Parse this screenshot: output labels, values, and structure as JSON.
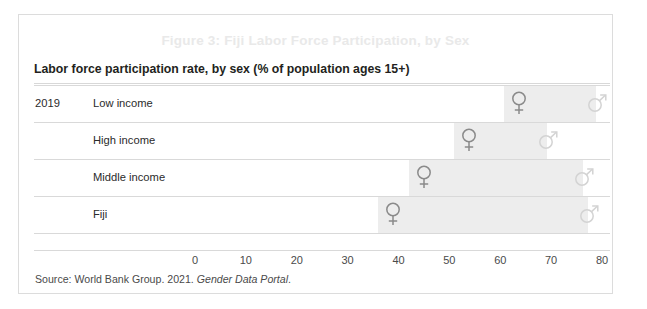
{
  "figure": {
    "caption": "Figure 3: Fiji Labor Force Participation, by Sex",
    "subtitle": "Labor force participation rate, by sex (% of population ages 15+)",
    "year_label": "2019",
    "source_prefix": "Source: World Bank Group. 2021. ",
    "source_italic": "Gender Data Portal",
    "source_suffix": "."
  },
  "colors": {
    "caption": "#e9e9e9",
    "text": "#231f20",
    "grid": "#d9d9d9",
    "band": "#ededed",
    "female_marker": "#8a8a8a",
    "male_marker": "#d3d3d3",
    "frame": "#dcdcdc"
  },
  "chart_data": {
    "type": "bar",
    "title": "Labor force participation rate, by sex (% of population ages 15+)",
    "xlabel": "",
    "ylabel": "",
    "xlim": [
      0,
      80
    ],
    "xticks": [
      0,
      10,
      20,
      30,
      40,
      50,
      60,
      70,
      80
    ],
    "xtick_labels": [
      "0",
      "10",
      "20",
      "30",
      "40",
      "50",
      "60",
      "70",
      "80"
    ],
    "grid": true,
    "legend": "none",
    "categories": [
      "Low income",
      "High income",
      "Middle income",
      "Fiji"
    ],
    "series": [
      {
        "name": "Female",
        "marker": "venus-symbol",
        "values": [
          63.7,
          53.8,
          45.0,
          39.0
        ]
      },
      {
        "name": "Male",
        "marker": "mars-symbol",
        "values": [
          79.0,
          69.3,
          76.4,
          77.5
        ]
      }
    ],
    "rows": [
      {
        "label": "Low income",
        "female": 63.7,
        "male": 79.0
      },
      {
        "label": "High income",
        "female": 53.8,
        "male": 69.3
      },
      {
        "label": "Middle income",
        "female": 45.0,
        "male": 76.4
      },
      {
        "label": "Fiji",
        "female": 39.0,
        "male": 77.5
      }
    ]
  }
}
